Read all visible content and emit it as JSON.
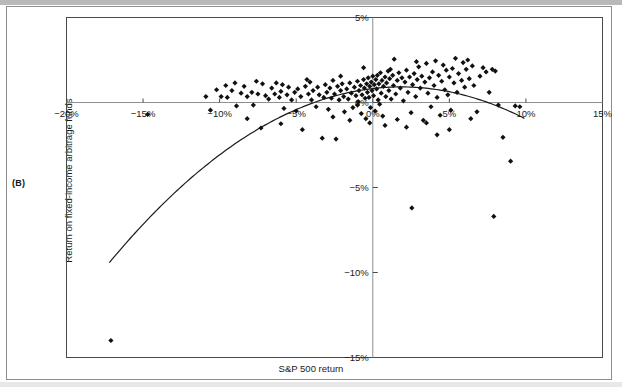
{
  "panel": {
    "letter": "(B)"
  },
  "chart_data": {
    "type": "scatter",
    "title": "",
    "xlabel": "S&P 500 return",
    "ylabel": "Return on fixed-income arbitrage funds",
    "xlim": [
      -20,
      15
    ],
    "ylim": [
      -15,
      5
    ],
    "xticks": [
      -20,
      -15,
      -10,
      -5,
      0,
      5,
      10,
      15
    ],
    "xticklabels": [
      "−20%",
      "−15%",
      "−10%",
      "−5%",
      "0%",
      "5%",
      "10%",
      "15%"
    ],
    "yticks": [
      5,
      0,
      -5,
      -10,
      -15
    ],
    "yticklabels": [
      "5%",
      "0%",
      "−5%",
      "−10%",
      "−15%"
    ],
    "grid": false,
    "legend": null,
    "marker": {
      "shape": "diamond",
      "color": "#111111",
      "size": 2.6
    },
    "axis_lines": {
      "x_at_y": 0,
      "y_at_x": 0,
      "color": "#8f8f8f"
    },
    "fit_curve": {
      "kind": "quadratic",
      "label": "fitted quadratic",
      "color": "#1a1a1a",
      "a": -0.0285,
      "b": 0.105,
      "c": 0.82,
      "x_start": -17.2,
      "x_end": 9.9
    },
    "points": [
      [
        -17.1,
        -14.0
      ],
      [
        -14.7,
        -0.7
      ],
      [
        -10.9,
        0.35
      ],
      [
        -10.6,
        -0.45
      ],
      [
        -10.2,
        0.75
      ],
      [
        -9.9,
        0.35
      ],
      [
        -9.6,
        1.0
      ],
      [
        -9.5,
        0.3
      ],
      [
        -9.2,
        0.7
      ],
      [
        -8.9,
        -0.2
      ],
      [
        -8.6,
        0.55
      ],
      [
        -8.4,
        0.95
      ],
      [
        -8.2,
        0.35
      ],
      [
        -7.9,
        0.6
      ],
      [
        -7.8,
        -0.15
      ],
      [
        -7.5,
        0.5
      ],
      [
        -7.2,
        1.1
      ],
      [
        -7.0,
        0.4
      ],
      [
        -6.8,
        0.2
      ],
      [
        -6.6,
        0.85
      ],
      [
        -6.4,
        0.5
      ],
      [
        -6.3,
        1.15
      ],
      [
        -6.1,
        0.3
      ],
      [
        -6.0,
        0.65
      ],
      [
        -5.8,
        -0.35
      ],
      [
        -5.6,
        0.45
      ],
      [
        -5.5,
        0.9
      ],
      [
        -5.3,
        0.15
      ],
      [
        -5.1,
        0.6
      ],
      [
        -5.0,
        -0.5
      ],
      [
        -4.9,
        0.8
      ],
      [
        -4.7,
        0.35
      ],
      [
        -4.6,
        -1.6
      ],
      [
        -4.4,
        0.95
      ],
      [
        -4.2,
        0.5
      ],
      [
        -4.1,
        1.2
      ],
      [
        -4.0,
        0.15
      ],
      [
        -3.9,
        0.7
      ],
      [
        -3.7,
        -0.25
      ],
      [
        -3.6,
        0.9
      ],
      [
        -3.5,
        0.45
      ],
      [
        -3.3,
        -2.1
      ],
      [
        -3.2,
        0.3
      ],
      [
        -3.1,
        1.05
      ],
      [
        -3.0,
        0.6
      ],
      [
        -2.9,
        -0.4
      ],
      [
        -2.8,
        0.85
      ],
      [
        -2.7,
        0.25
      ],
      [
        -2.6,
        1.3
      ],
      [
        -2.5,
        0.5
      ],
      [
        -2.4,
        -2.15
      ],
      [
        -2.3,
        0.95
      ],
      [
        -2.2,
        0.15
      ],
      [
        -2.1,
        0.7
      ],
      [
        -2.0,
        1.1
      ],
      [
        -1.9,
        0.35
      ],
      [
        -1.85,
        -0.55
      ],
      [
        -1.7,
        0.8
      ],
      [
        -1.6,
        0.2
      ],
      [
        -1.5,
        1.15
      ],
      [
        -1.4,
        0.55
      ],
      [
        -1.3,
        -0.3
      ],
      [
        -1.2,
        0.9
      ],
      [
        -1.1,
        0.4
      ],
      [
        -1.0,
        1.25
      ],
      [
        -0.95,
        0.05
      ],
      [
        -0.9,
        0.7
      ],
      [
        -0.8,
        1.0
      ],
      [
        -0.75,
        -0.65
      ],
      [
        -0.7,
        0.45
      ],
      [
        -0.6,
        1.35
      ],
      [
        -0.55,
        0.85
      ],
      [
        -0.5,
        0.25
      ],
      [
        -0.45,
        -0.95
      ],
      [
        -0.4,
        1.1
      ],
      [
        -0.35,
        0.6
      ],
      [
        -0.3,
        1.45
      ],
      [
        -0.25,
        0.3
      ],
      [
        -0.2,
        0.95
      ],
      [
        -0.15,
        -0.3
      ],
      [
        -0.1,
        1.2
      ],
      [
        -0.05,
        0.7
      ],
      [
        0.0,
        1.55
      ],
      [
        0.05,
        0.4
      ],
      [
        0.1,
        1.05
      ],
      [
        0.15,
        -0.5
      ],
      [
        0.2,
        1.35
      ],
      [
        0.25,
        0.8
      ],
      [
        0.3,
        1.6
      ],
      [
        0.35,
        0.15
      ],
      [
        0.4,
        1.1
      ],
      [
        0.5,
        1.75
      ],
      [
        0.55,
        0.55
      ],
      [
        0.6,
        1.3
      ],
      [
        0.65,
        -0.8
      ],
      [
        0.7,
        0.95
      ],
      [
        0.8,
        1.5
      ],
      [
        0.85,
        0.35
      ],
      [
        0.9,
        1.15
      ],
      [
        1.0,
        1.85
      ],
      [
        1.05,
        0.7
      ],
      [
        1.1,
        1.4
      ],
      [
        1.2,
        0.2
      ],
      [
        1.3,
        1.6
      ],
      [
        1.35,
        1.0
      ],
      [
        1.4,
        2.55
      ],
      [
        1.5,
        0.5
      ],
      [
        1.6,
        1.3
      ],
      [
        1.7,
        1.75
      ],
      [
        1.8,
        0.85
      ],
      [
        1.9,
        1.45
      ],
      [
        2.0,
        0.1
      ],
      [
        2.1,
        1.2
      ],
      [
        2.2,
        1.9
      ],
      [
        2.3,
        0.6
      ],
      [
        2.4,
        1.5
      ],
      [
        2.5,
        -0.6
      ],
      [
        2.6,
        1.05
      ],
      [
        2.7,
        1.7
      ],
      [
        2.8,
        0.35
      ],
      [
        2.9,
        1.35
      ],
      [
        3.0,
        2.1
      ],
      [
        3.1,
        0.85
      ],
      [
        3.2,
        1.55
      ],
      [
        3.3,
        -1.05
      ],
      [
        3.4,
        1.2
      ],
      [
        3.5,
        2.3
      ],
      [
        3.6,
        0.55
      ],
      [
        3.7,
        1.45
      ],
      [
        3.8,
        -0.25
      ],
      [
        3.9,
        1.8
      ],
      [
        4.0,
        1.0
      ],
      [
        4.1,
        2.45
      ],
      [
        4.2,
        0.3
      ],
      [
        4.3,
        1.6
      ],
      [
        4.4,
        -0.75
      ],
      [
        4.5,
        1.25
      ],
      [
        4.6,
        2.2
      ],
      [
        4.7,
        0.75
      ],
      [
        4.8,
        1.9
      ],
      [
        4.9,
        0.45
      ],
      [
        5.0,
        1.5
      ],
      [
        5.1,
        -0.45
      ],
      [
        5.2,
        2.0
      ],
      [
        5.3,
        1.15
      ],
      [
        5.4,
        2.6
      ],
      [
        5.5,
        0.6
      ],
      [
        5.6,
        1.7
      ],
      [
        5.8,
        1.3
      ],
      [
        5.9,
        2.35
      ],
      [
        6.0,
        0.9
      ],
      [
        6.1,
        1.95
      ],
      [
        6.2,
        2.5
      ],
      [
        6.3,
        1.4
      ],
      [
        6.5,
        2.15
      ],
      [
        6.6,
        1.0
      ],
      [
        6.8,
        -0.55
      ],
      [
        7.0,
        1.55
      ],
      [
        7.2,
        2.05
      ],
      [
        7.4,
        1.8
      ],
      [
        7.6,
        0.6
      ],
      [
        7.8,
        1.95
      ],
      [
        8.0,
        1.85
      ],
      [
        8.2,
        -0.15
      ],
      [
        8.5,
        -2.05
      ],
      [
        9.0,
        -3.45
      ],
      [
        9.3,
        -0.2
      ],
      [
        9.6,
        -0.25
      ],
      [
        -8.2,
        -0.95
      ],
      [
        -7.3,
        -1.5
      ],
      [
        -6.0,
        -1.25
      ],
      [
        2.55,
        -6.2
      ],
      [
        7.9,
        -6.7
      ],
      [
        -1.0,
        -0.15
      ],
      [
        0.45,
        -0.1
      ],
      [
        1.15,
        1.95
      ],
      [
        2.85,
        2.4
      ],
      [
        -0.6,
        2.05
      ],
      [
        -2.1,
        1.55
      ],
      [
        -4.3,
        1.35
      ],
      [
        -5.9,
        1.05
      ],
      [
        -7.6,
        1.25
      ],
      [
        -9.0,
        1.15
      ],
      [
        0.8,
        -1.35
      ],
      [
        1.6,
        -1.0
      ],
      [
        2.2,
        -1.45
      ],
      [
        3.5,
        -1.2
      ],
      [
        5.0,
        -1.6
      ],
      [
        -0.2,
        -1.2
      ],
      [
        -1.5,
        -1.05
      ],
      [
        6.4,
        -0.95
      ],
      [
        4.2,
        -1.9
      ],
      [
        -2.6,
        -0.85
      ]
    ]
  }
}
